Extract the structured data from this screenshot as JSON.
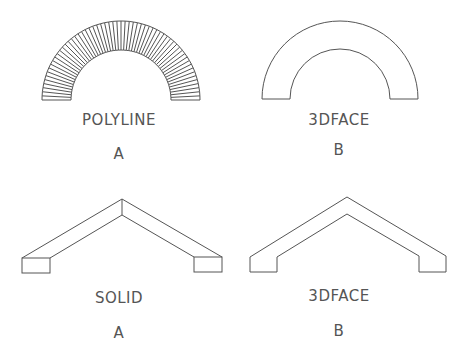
{
  "figures": [
    {
      "id": "polyline-arch",
      "method": "POLYLINE",
      "variant": "A"
    },
    {
      "id": "3dface-arch",
      "method": "3DFACE",
      "variant": "B"
    },
    {
      "id": "solid-roof",
      "method": "SOLID",
      "variant": "A"
    },
    {
      "id": "3dface-roof",
      "method": "3DFACE",
      "variant": "B"
    }
  ],
  "colors": {
    "line": "#555555",
    "background": "#ffffff"
  }
}
